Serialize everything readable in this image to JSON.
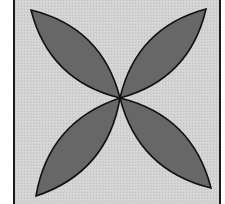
{
  "figure": {
    "colors": {
      "page_background": "#ffffff",
      "square_fill": "#d2d2d2",
      "square_border": "#1a1a1a",
      "petal_fill": "#676767",
      "petal_outline": "#111111"
    },
    "square": {
      "left": 14,
      "right": 220,
      "top": 0,
      "bottom": 204
    },
    "center": {
      "x": 120,
      "y": 98
    },
    "petals": [
      {
        "name": "top-left",
        "tip": {
          "x": 31,
          "y": 10
        }
      },
      {
        "name": "top-right",
        "tip": {
          "x": 206,
          "y": 9
        }
      },
      {
        "name": "bottom-left",
        "tip": {
          "x": 36,
          "y": 196
        }
      },
      {
        "name": "bottom-right",
        "tip": {
          "x": 211,
          "y": 188
        }
      }
    ]
  }
}
